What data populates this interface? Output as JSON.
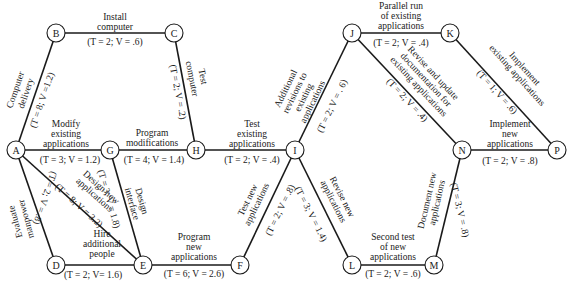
{
  "nodes": {
    "A": {
      "label": "A",
      "x": 16,
      "y": 150
    },
    "B": {
      "label": "B",
      "x": 56,
      "y": 33
    },
    "C": {
      "label": "C",
      "x": 174,
      "y": 33
    },
    "D": {
      "label": "D",
      "x": 56,
      "y": 265
    },
    "E": {
      "label": "E",
      "x": 143,
      "y": 265
    },
    "F": {
      "label": "F",
      "x": 240,
      "y": 265
    },
    "G": {
      "label": "G",
      "x": 110,
      "y": 150
    },
    "H": {
      "label": "H",
      "x": 196,
      "y": 150
    },
    "I": {
      "label": "I",
      "x": 295,
      "y": 150
    },
    "J": {
      "label": "J",
      "x": 352,
      "y": 33
    },
    "K": {
      "label": "K",
      "x": 450,
      "y": 33
    },
    "L": {
      "label": "L",
      "x": 352,
      "y": 265
    },
    "M": {
      "label": "M",
      "x": 434,
      "y": 265
    },
    "N": {
      "label": "N",
      "x": 462,
      "y": 150
    },
    "P": {
      "label": "P",
      "x": 557,
      "y": 150
    }
  },
  "edges": {
    "AB": {
      "from": "A",
      "to": "B",
      "activity": [
        "Computer",
        "delivery"
      ],
      "params": "(T = 8; V =1.2)"
    },
    "BC": {
      "from": "B",
      "to": "C",
      "activity": [
        "Install",
        "computer"
      ],
      "params": "(T = 2; V = .6)"
    },
    "CH": {
      "from": "C",
      "to": "H",
      "activity": [
        "Test",
        "computer"
      ],
      "params": "(T = 2; V = .2)"
    },
    "AG": {
      "from": "A",
      "to": "G",
      "activity": [
        "Modify",
        "existing",
        "applications"
      ],
      "params": "(T = 3; V = 1.2)"
    },
    "GH": {
      "from": "G",
      "to": "H",
      "activity": [
        "Program",
        "modifications"
      ],
      "params": "(T = 4; V = 1.4)"
    },
    "HI": {
      "from": "H",
      "to": "I",
      "activity": [
        "Test",
        "existing",
        "applications"
      ],
      "params": "(T = 2; V = .4)"
    },
    "AD": {
      "from": "A",
      "to": "D",
      "activity": [
        "Evaluate",
        "manpower"
      ],
      "params": "(T = 2; V = .8)"
    },
    "AE": {
      "from": "A",
      "to": "E",
      "activity": [
        "Design new",
        "applications"
      ],
      "params": "(T = 8; V = 3.2)"
    },
    "GE": {
      "from": "G",
      "to": "E",
      "activity": [
        "Design",
        "interface"
      ],
      "params": "(T = 3; V = 1.8)"
    },
    "DE": {
      "from": "D",
      "to": "E",
      "activity": [
        "Hire",
        "additional",
        "people"
      ],
      "params": "(T = 2; V= 1.6)"
    },
    "EF": {
      "from": "E",
      "to": "F",
      "activity": [
        "Program",
        "new",
        "applications"
      ],
      "params": "(T = 6; V = 2.6)"
    },
    "FI": {
      "from": "F",
      "to": "I",
      "activity": [
        "Test new",
        "applications"
      ],
      "params": "(T = 2; V = .8)"
    },
    "IJ": {
      "from": "I",
      "to": "J",
      "activity": [
        "Additional",
        "revisions to",
        "existing",
        "applications"
      ],
      "params": "(T = 2; V = . 6)"
    },
    "IL": {
      "from": "I",
      "to": "L",
      "activity": [
        "Revise new",
        "applications"
      ],
      "params": "(T = 3; V = 1.4)"
    },
    "JK": {
      "from": "J",
      "to": "K",
      "activity": [
        "Parallel run",
        "of existing",
        "applications"
      ],
      "params": "(T = 2; V = .4)"
    },
    "JN": {
      "from": "J",
      "to": "N",
      "activity": [
        "Revise and update",
        "documentation for",
        "existing applications"
      ],
      "params": "(T = 2; V = .4)"
    },
    "KP": {
      "from": "K",
      "to": "P",
      "activity": [
        "Implement",
        "existing applications"
      ],
      "params": "(T = 1; V = .6)"
    },
    "LM": {
      "from": "L",
      "to": "M",
      "activity": [
        "Second test",
        "of new",
        "applications"
      ],
      "params": "(T = 2; V = .6)"
    },
    "MN": {
      "from": "M",
      "to": "N",
      "activity": [
        "Document new",
        "applications"
      ],
      "params": "(T = 3; V = .8)"
    },
    "NP": {
      "from": "N",
      "to": "P",
      "activity": [
        "Implement",
        "new",
        "applications"
      ],
      "params": "(T = 2; V = .8)"
    }
  }
}
